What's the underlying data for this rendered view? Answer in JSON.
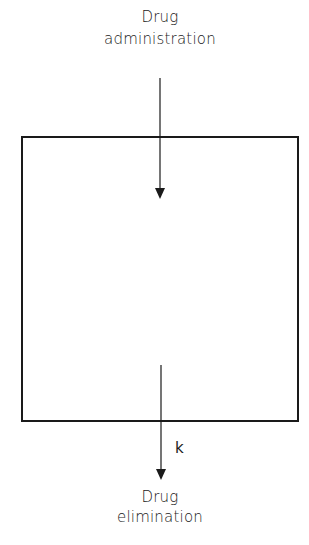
{
  "diagram": {
    "input": {
      "line1": "Drug",
      "line2": "administration"
    },
    "output": {
      "line1": "Drug",
      "line2": "elimination"
    },
    "rate_constant": "k",
    "colors": {
      "stroke": "#1a1a1a",
      "background": "#ffffff"
    }
  }
}
